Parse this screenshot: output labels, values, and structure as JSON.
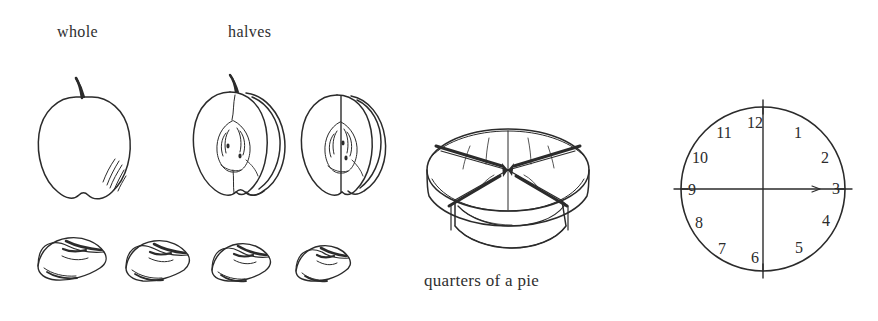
{
  "page": {
    "background_color": "#ffffff",
    "ink_color": "#2b2b2b",
    "width": 878,
    "height": 321
  },
  "labels": {
    "whole": "whole",
    "halves": "halves"
  },
  "captions": {
    "pie": "quarters of a pie"
  },
  "illustrations": {
    "whole_apple": "whole-apple-drawing",
    "apple_half_left": "apple-half-drawing",
    "apple_half_right": "apple-half-drawing",
    "apple_quarters": [
      "apple-quarter-wedge",
      "apple-quarter-wedge",
      "apple-quarter-wedge",
      "apple-quarter-wedge"
    ],
    "pie": "pie-cut-into-quarters-drawing",
    "clock": "clock-face-divided-into-quarters"
  },
  "clock": {
    "numbers": [
      "12",
      "1",
      "2",
      "3",
      "4",
      "5",
      "6",
      "7",
      "8",
      "9",
      "10",
      "11"
    ],
    "hands": [
      "vertical-12-to-6",
      "horizontal-9-to-3"
    ],
    "tick_positions": [
      "12",
      "3",
      "6",
      "9"
    ]
  }
}
